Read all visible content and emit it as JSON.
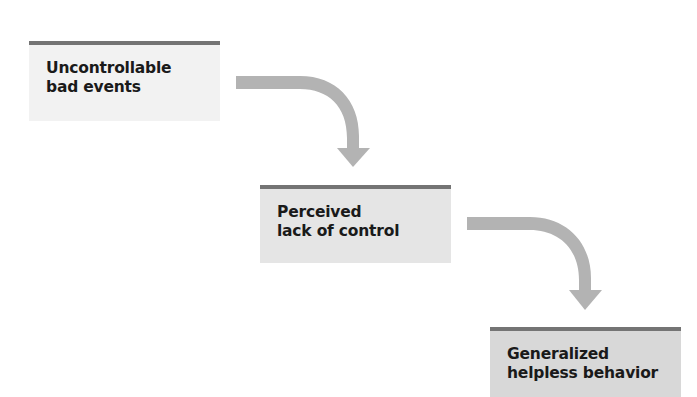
{
  "diagram": {
    "type": "flowchart",
    "direction": "top-left to bottom-right, stepped",
    "colors": {
      "box_bar": "#747474",
      "box1_fill": "#f2f2f2",
      "box2_fill": "#e5e5e5",
      "box3_fill": "#d8d8d8",
      "arrow": "#b3b3b3",
      "text": "#1a1a1a"
    },
    "nodes": [
      {
        "id": "uncontrollable-bad-events",
        "lines": [
          "Uncontrollable",
          "bad events"
        ]
      },
      {
        "id": "perceived-lack-of-control",
        "lines": [
          "Perceived",
          "lack of control"
        ]
      },
      {
        "id": "generalized-helpless-behavior",
        "lines": [
          "Generalized",
          "helpless behavior"
        ]
      }
    ],
    "edges": [
      {
        "from": "uncontrollable-bad-events",
        "to": "perceived-lack-of-control",
        "style": "curved-arrow"
      },
      {
        "from": "perceived-lack-of-control",
        "to": "generalized-helpless-behavior",
        "style": "curved-arrow"
      }
    ]
  }
}
